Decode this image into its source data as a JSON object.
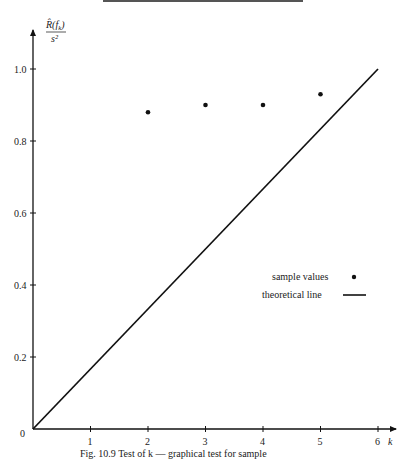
{
  "chart_data": {
    "type": "scatter",
    "title": "",
    "xlabel": "k",
    "ylabel": "R̂(f_k) / s²",
    "ylabel_parts": {
      "numerator": "R̂(f",
      "subscript": "k",
      "close": ")",
      "denominator": "s²"
    },
    "xlim": [
      0,
      6
    ],
    "ylim": [
      0,
      1.0
    ],
    "x_ticks": [
      1,
      2,
      3,
      4,
      5,
      6
    ],
    "y_ticks": [
      0.2,
      0.4,
      0.6,
      0.8,
      1.0
    ],
    "origin_label": "0",
    "grid": false,
    "legend_position": "right-middle",
    "series": [
      {
        "name": "sample values",
        "type": "scatter",
        "x": [
          2,
          3,
          4,
          5
        ],
        "values": [
          0.88,
          0.9,
          0.9,
          0.93
        ]
      },
      {
        "name": "theoretical line",
        "type": "line",
        "x": [
          0,
          6
        ],
        "values": [
          0,
          1.0
        ]
      }
    ]
  },
  "legend": {
    "sample_label": "sample values",
    "line_label": "theoretical line"
  },
  "axes": {
    "x_tick_labels": [
      "1",
      "2",
      "3",
      "4",
      "5",
      "6"
    ],
    "y_tick_labels": [
      "0.2",
      "0.4",
      "0.6",
      "0.8",
      "1.0"
    ],
    "origin": "0",
    "x_axis_name": "k"
  },
  "caption": "Fig. 10.9   Test of k — graphical test for sample"
}
